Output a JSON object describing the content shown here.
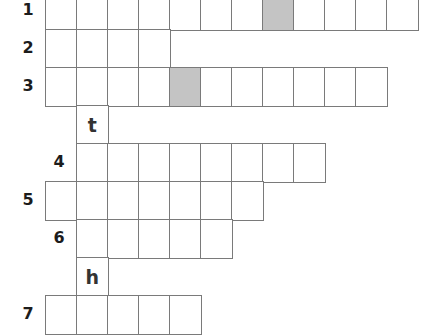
{
  "puzzle": {
    "type": "crossword-grid",
    "colors": {
      "line": "#7a7a7a",
      "shaded": "#c4c4c4",
      "background": "#ffffff",
      "text": "#1c1c1c"
    },
    "rows": [
      {
        "label": "1",
        "start_col": 0,
        "length": 12,
        "shaded_cols": [
          7
        ],
        "letters": {}
      },
      {
        "label": "2",
        "start_col": 0,
        "length": 4,
        "shaded_cols": [],
        "letters": {}
      },
      {
        "label": "3",
        "start_col": 0,
        "length": 11,
        "shaded_cols": [
          4
        ],
        "letters": {}
      },
      {
        "label": "",
        "start_col": 1,
        "length": 1,
        "shaded_cols": [],
        "letters": {
          "1": "t"
        }
      },
      {
        "label": "4",
        "start_col": 1,
        "length": 8,
        "shaded_cols": [],
        "letters": {}
      },
      {
        "label": "5",
        "start_col": 0,
        "length": 7,
        "shaded_cols": [],
        "letters": {}
      },
      {
        "label": "6",
        "start_col": 1,
        "length": 5,
        "shaded_cols": [],
        "letters": {}
      },
      {
        "label": "",
        "start_col": 1,
        "length": 1,
        "shaded_cols": [],
        "letters": {
          "1": "h"
        }
      },
      {
        "label": "7",
        "start_col": 0,
        "length": 5,
        "shaded_cols": [],
        "letters": {}
      }
    ]
  }
}
